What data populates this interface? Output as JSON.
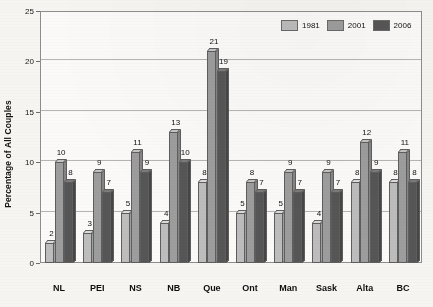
{
  "chart_data": {
    "type": "bar",
    "title": "",
    "xlabel": "",
    "ylabel": "Percentage of All Couples",
    "ylim": [
      0,
      25
    ],
    "yticks": [
      0,
      5,
      10,
      15,
      20,
      25
    ],
    "grid": true,
    "legend_position": "top-right",
    "categories": [
      "NL",
      "PEI",
      "NS",
      "NB",
      "Que",
      "Ont",
      "Man",
      "Sask",
      "Alta",
      "BC"
    ],
    "series": [
      {
        "name": "1981",
        "color": "#bdbdbd",
        "values": [
          2,
          3,
          5,
          4,
          8,
          5,
          5,
          4,
          8,
          8
        ]
      },
      {
        "name": "2001",
        "color": "#9d9d9d",
        "values": [
          10,
          9,
          11,
          13,
          21,
          8,
          9,
          9,
          12,
          11
        ]
      },
      {
        "name": "2006",
        "color": "#565656",
        "values": [
          8,
          7,
          9,
          10,
          19,
          7,
          7,
          7,
          9,
          8
        ]
      }
    ]
  },
  "legend": {
    "items": [
      {
        "label": "1981"
      },
      {
        "label": "2001"
      },
      {
        "label": "2006"
      }
    ]
  }
}
